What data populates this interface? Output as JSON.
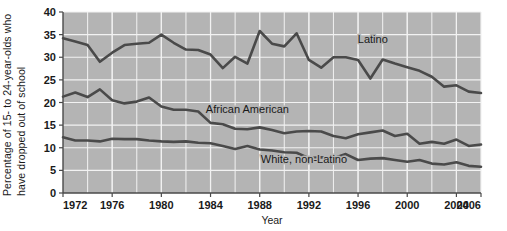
{
  "chart_data": {
    "type": "line",
    "title": "",
    "xlabel": "Year",
    "ylabel": "Percentage of 15- to 24-year-olds who have dropped out of school",
    "ylabel_line1": "Percentage of 15- to  24-year-olds who",
    "ylabel_line2": "have dropped out of school",
    "xlim": [
      1972,
      2006
    ],
    "ylim": [
      0,
      40
    ],
    "yticks": [
      0,
      5,
      10,
      15,
      20,
      25,
      30,
      35,
      40
    ],
    "ytick_labels": [
      "0",
      "5",
      "10",
      "15",
      "20",
      "25",
      "30",
      "35",
      "40"
    ],
    "xticks": [
      1972,
      1976,
      1980,
      1984,
      1988,
      1992,
      1996,
      2000,
      2004,
      2006
    ],
    "xtick_labels": [
      "1972",
      "1976",
      "1980",
      "1984",
      "1988",
      "1992",
      "1996",
      "2000",
      "2004",
      "2006"
    ],
    "grid": true,
    "grid_color": "#f2f2f2",
    "plot_background": "#b4b4b4",
    "line_color": "#4a4a4a",
    "legend_position": "inline-annotations",
    "x": [
      1972,
      1973,
      1974,
      1975,
      1976,
      1977,
      1978,
      1979,
      1980,
      1981,
      1982,
      1983,
      1984,
      1985,
      1986,
      1987,
      1988,
      1989,
      1990,
      1991,
      1992,
      1993,
      1994,
      1995,
      1996,
      1997,
      1998,
      1999,
      2000,
      2001,
      2002,
      2003,
      2004,
      2005,
      2006
    ],
    "series": [
      {
        "name": "Latino",
        "label": "Latino",
        "label_x": 1997.2,
        "label_y": 33.2,
        "values": [
          34.2,
          33.5,
          32.7,
          29.0,
          31.0,
          32.7,
          33.0,
          33.2,
          35.0,
          33.2,
          31.7,
          31.6,
          30.6,
          27.6,
          30.1,
          28.6,
          35.8,
          33.0,
          32.4,
          35.3,
          29.4,
          27.7,
          30.0,
          30.0,
          29.4,
          25.3,
          29.5,
          28.6,
          27.8,
          27.0,
          25.7,
          23.5,
          23.8,
          22.4,
          22.1
        ]
      },
      {
        "name": "African American",
        "label": "African American",
        "label_x": 1987.0,
        "label_y": 17.6,
        "values": [
          21.3,
          22.2,
          21.2,
          22.9,
          20.5,
          19.8,
          20.2,
          21.1,
          19.1,
          18.4,
          18.4,
          18.0,
          15.5,
          15.2,
          14.2,
          14.1,
          14.5,
          13.9,
          13.2,
          13.6,
          13.7,
          13.6,
          12.6,
          12.1,
          13.0,
          13.4,
          13.8,
          12.6,
          13.1,
          10.9,
          11.3,
          10.9,
          11.8,
          10.4,
          10.7
        ]
      },
      {
        "name": "White, non-Latino",
        "label": "White, non-Latino",
        "label_x": 1991.6,
        "label_y": 6.6,
        "values": [
          12.3,
          11.6,
          11.6,
          11.4,
          12.0,
          11.9,
          11.9,
          11.6,
          11.4,
          11.3,
          11.4,
          11.1,
          11.0,
          10.4,
          9.7,
          10.4,
          9.6,
          9.4,
          9.0,
          8.9,
          7.7,
          7.9,
          7.7,
          8.6,
          7.3,
          7.6,
          7.7,
          7.3,
          6.9,
          7.3,
          6.5,
          6.3,
          6.8,
          6.0,
          5.8
        ]
      }
    ]
  }
}
